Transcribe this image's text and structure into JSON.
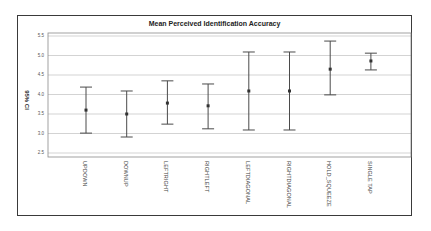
{
  "chart_data": {
    "type": "errorbar",
    "title": "Mean Perceived Identification Accuracy",
    "xlabel": "",
    "ylabel": "95% CI",
    "ylim": [
      2.5,
      5.5
    ],
    "yticks": [
      "5.5",
      "5.0",
      "4.5",
      "4.0",
      "3.5",
      "3.0",
      "2.5"
    ],
    "grid": true,
    "legend": null,
    "categories": [
      "UPDOWN",
      "DOWNUP",
      "LEFTRIGHT",
      "RIGHTLEFT",
      "LEFTDIAGONAL",
      "RIGHTDIAGONAL",
      "HOLD_SQUEEZE",
      "SINGLE TAP"
    ],
    "series": [
      {
        "name": "Mean with 95% CI",
        "mean": [
          3.6,
          3.5,
          3.78,
          3.71,
          4.09,
          4.09,
          4.65,
          4.86
        ],
        "lower": [
          3.01,
          2.91,
          3.24,
          3.12,
          3.09,
          3.09,
          3.99,
          4.63
        ],
        "upper": [
          4.19,
          4.09,
          4.35,
          4.27,
          5.09,
          5.09,
          5.37,
          5.06
        ]
      }
    ]
  },
  "colors": {
    "gridline": "#c8c8c8",
    "errorbar": "#4a4a4a",
    "frame": "#3a3a3a"
  }
}
